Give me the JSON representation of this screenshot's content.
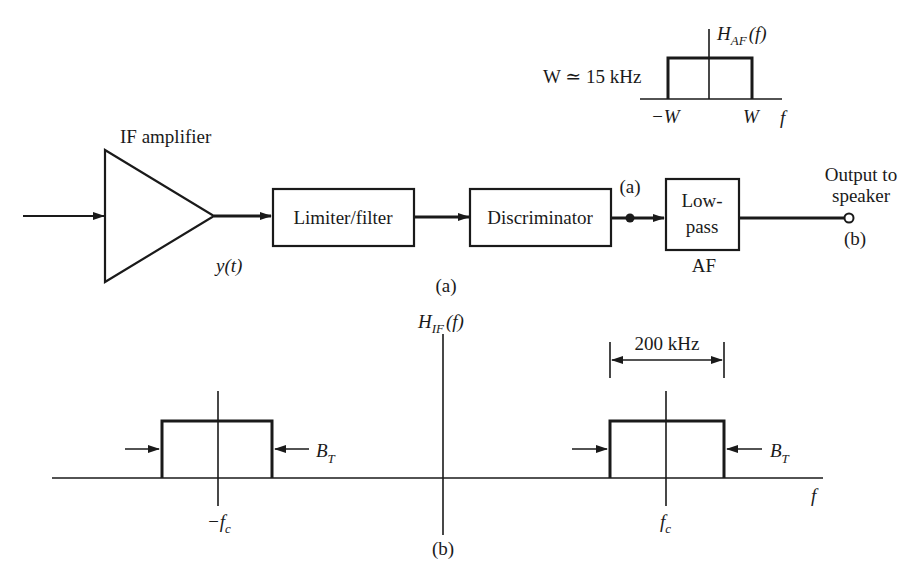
{
  "figure": {
    "part_a_caption": "(a)",
    "part_b_caption": "(b)"
  },
  "block_diagram": {
    "amplifier": {
      "label": "IF amplifier",
      "output_signal": "y(t)"
    },
    "blocks": [
      {
        "id": "limiter",
        "label": "Limiter/filter"
      },
      {
        "id": "discriminator",
        "label": "Discriminator"
      },
      {
        "id": "lowpass",
        "label_line1": "Low-",
        "label_line2": "pass",
        "sub_label": "AF"
      }
    ],
    "node_a_label": "(a)",
    "output": {
      "label_line1": "Output to",
      "label_line2": "speaker",
      "node_label": "(b)"
    }
  },
  "af_response": {
    "title_main": "H",
    "title_sub": "AF",
    "title_arg": "(f)",
    "bandwidth_note": "W ≃ 15 kHz",
    "neg_edge": "−W",
    "pos_edge": "W",
    "axis_label": "f"
  },
  "if_response": {
    "title_main": "H",
    "title_sub": "IF",
    "title_arg": "(f)",
    "neg_center": "−f",
    "neg_center_sub": "c",
    "pos_center": "f",
    "pos_center_sub": "c",
    "bandwidth_label": "B",
    "bandwidth_sub": "T",
    "span_label": "200 kHz",
    "axis_label": "f"
  },
  "colors": {
    "ink": "#1a1a1a",
    "background": "#ffffff"
  }
}
